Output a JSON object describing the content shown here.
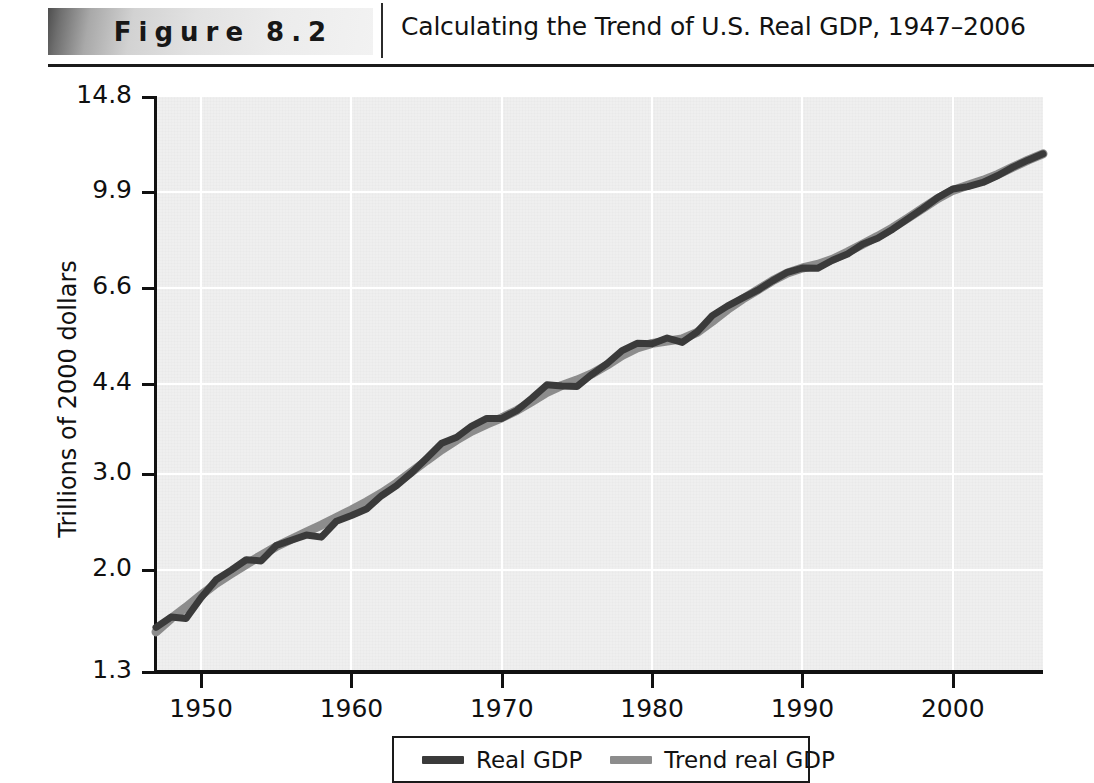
{
  "header": {
    "banner_label": "Figure 8.2",
    "caption": "Calculating the Trend of U.S. Real GDP, 1947–2006"
  },
  "legend": {
    "items": [
      {
        "label": "Real GDP",
        "color": "#3a3a3a"
      },
      {
        "label": "Trend real GDP",
        "color": "#8c8c8c"
      }
    ]
  },
  "chart_data": {
    "type": "line",
    "title": "Calculating the Trend of U.S. Real GDP, 1947–2006",
    "xlabel": "",
    "ylabel": "Trillions of 2000 dollars",
    "yscale": "log",
    "ylim": [
      1.3,
      14.8
    ],
    "xlim": [
      1947,
      2006
    ],
    "grid": true,
    "legend_position": "bottom",
    "ytick_labels": [
      "14.8",
      "9.9",
      "6.6",
      "4.4",
      "3.0",
      "2.0",
      "1.3"
    ],
    "yticks": [
      14.8,
      9.9,
      6.6,
      4.4,
      3.0,
      2.0,
      1.3
    ],
    "xtick_labels": [
      "1950",
      "1960",
      "1970",
      "1980",
      "1990",
      "2000"
    ],
    "xticks": [
      1950,
      1960,
      1970,
      1980,
      1990,
      2000
    ],
    "x": [
      1947,
      1948,
      1949,
      1950,
      1951,
      1952,
      1953,
      1954,
      1955,
      1956,
      1957,
      1958,
      1959,
      1960,
      1961,
      1962,
      1963,
      1964,
      1965,
      1966,
      1967,
      1968,
      1969,
      1970,
      1971,
      1972,
      1973,
      1974,
      1975,
      1976,
      1977,
      1978,
      1979,
      1980,
      1981,
      1982,
      1983,
      1984,
      1985,
      1986,
      1987,
      1988,
      1989,
      1990,
      1991,
      1992,
      1993,
      1994,
      1995,
      1996,
      1997,
      1998,
      1999,
      2000,
      2001,
      2002,
      2003,
      2004,
      2005,
      2006
    ],
    "series": [
      {
        "name": "Real GDP",
        "color": "#3a3a3a",
        "values": [
          1.57,
          1.64,
          1.63,
          1.78,
          1.92,
          2.0,
          2.09,
          2.08,
          2.22,
          2.27,
          2.32,
          2.3,
          2.46,
          2.52,
          2.59,
          2.74,
          2.86,
          3.02,
          3.21,
          3.42,
          3.51,
          3.68,
          3.8,
          3.8,
          3.93,
          4.14,
          4.38,
          4.36,
          4.35,
          4.58,
          4.79,
          5.06,
          5.22,
          5.21,
          5.34,
          5.24,
          5.48,
          5.87,
          6.11,
          6.32,
          6.53,
          6.8,
          7.05,
          7.18,
          7.17,
          7.42,
          7.62,
          7.94,
          8.14,
          8.46,
          8.84,
          9.23,
          9.67,
          10.03,
          10.13,
          10.31,
          10.62,
          11.0,
          11.33,
          11.64
        ]
      },
      {
        "name": "Trend real GDP",
        "color": "#8c8c8c",
        "values": [
          1.54,
          1.63,
          1.71,
          1.8,
          1.89,
          1.97,
          2.05,
          2.13,
          2.21,
          2.28,
          2.35,
          2.42,
          2.5,
          2.58,
          2.67,
          2.77,
          2.89,
          3.03,
          3.18,
          3.33,
          3.47,
          3.6,
          3.71,
          3.81,
          3.93,
          4.08,
          4.24,
          4.37,
          4.47,
          4.59,
          4.76,
          4.96,
          5.12,
          5.22,
          5.27,
          5.32,
          5.47,
          5.73,
          6.02,
          6.29,
          6.54,
          6.8,
          7.03,
          7.18,
          7.29,
          7.45,
          7.68,
          7.94,
          8.21,
          8.51,
          8.86,
          9.24,
          9.63,
          9.97,
          10.19,
          10.4,
          10.67,
          11.0,
          11.33,
          11.64
        ]
      }
    ]
  }
}
